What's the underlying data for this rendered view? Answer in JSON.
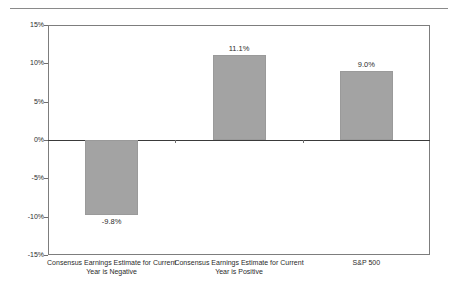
{
  "chart_data": {
    "type": "bar",
    "title": "",
    "subtitle": "",
    "xlabel": "",
    "ylabel": "",
    "categories": [
      "Consensus Earnings Estimate for Current Year is Negative",
      "Consensus Earnings Estimate for Current Year is Positive",
      "S&P 500"
    ],
    "category_lines": [
      [
        "Consensus Earnings Estimate for Current",
        "Year is Negative"
      ],
      [
        "Consensus Earnings Estimate for Current",
        "Year is Positive"
      ],
      [
        "S&P 500"
      ]
    ],
    "values": [
      -9.8,
      11.1,
      9.0
    ],
    "data_labels": [
      "-9.8%",
      "11.1%",
      "9.0%"
    ],
    "ylim": [
      -15,
      15
    ],
    "ytick_values": [
      15,
      10,
      5,
      0,
      -5,
      -10,
      -15
    ],
    "ytick_labels": [
      "15%",
      "10%",
      "5%",
      "0%",
      "-5%",
      "-10%",
      "-15%"
    ],
    "grid": false,
    "legend": false,
    "legend_position": "none",
    "bar_color": "#a3a3a3",
    "axis_color": "#7d7d7d",
    "zero_line_color": "#3a3a3a",
    "text_color": "#2b2b2b",
    "background": "#ffffff"
  },
  "decorations": {
    "top_rule_color": "#8a8a8a"
  }
}
